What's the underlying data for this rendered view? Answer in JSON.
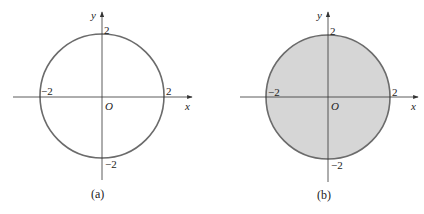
{
  "figures": [
    {
      "id": "a",
      "caption": "(a)",
      "filled": false,
      "x_axis_label": "x",
      "y_axis_label": "y",
      "origin_label": "O",
      "ticks": {
        "top": "2",
        "bottom": "−2",
        "left": "−2",
        "right": "2"
      }
    },
    {
      "id": "b",
      "caption": "(b)",
      "filled": true,
      "x_axis_label": "x",
      "y_axis_label": "y",
      "origin_label": "O",
      "ticks": {
        "top": "2",
        "bottom": "−2",
        "left": "−2",
        "right": "2"
      }
    }
  ],
  "colors": {
    "circle_stroke": "#6b6b6b",
    "fill": "#d6d6d6",
    "axis": "#333333"
  }
}
